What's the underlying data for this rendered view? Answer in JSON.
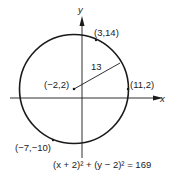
{
  "diagram": {
    "type": "circle-on-coordinate-plane",
    "axes": {
      "x_label": "x",
      "y_label": "y"
    },
    "center": {
      "label": "(−2,2)",
      "x": -2,
      "y": 2
    },
    "radius": {
      "label": "13",
      "value": 13
    },
    "points": [
      {
        "label": "(3,14)",
        "x": 3,
        "y": 14
      },
      {
        "label": "(11,2)",
        "x": 11,
        "y": 2
      },
      {
        "label": "(−7,−10)",
        "x": -7,
        "y": -10
      }
    ],
    "equation": "(x + 2)² + (y − 2)² = 169"
  },
  "colors": {
    "stroke": "#1a1a1a",
    "text": "#222222",
    "background": "#ffffff"
  }
}
